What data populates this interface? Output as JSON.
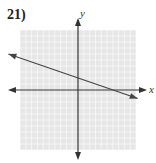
{
  "problem_number": "21)",
  "graph": {
    "x_axis_label": "x",
    "y_axis_label": "y",
    "x_range": [
      -10,
      10
    ],
    "y_range": [
      -10,
      10
    ],
    "grid": true,
    "line": {
      "slope": -0.3333,
      "y_intercept": 2,
      "x_start": -12,
      "x_end": 10.3,
      "arrows": "both"
    },
    "colors": {
      "grid": "#d9d9d9",
      "grid_bg": "#e6e6e6",
      "axis": "#333333",
      "line": "#444444"
    }
  }
}
